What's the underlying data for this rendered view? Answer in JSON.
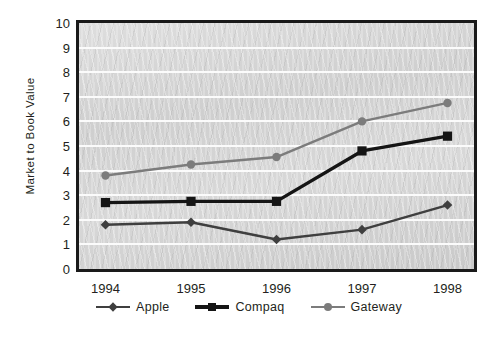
{
  "chart_data": {
    "type": "line",
    "title": "",
    "xlabel": "",
    "ylabel": "Market to Book Value",
    "categories": [
      "1994",
      "1995",
      "1996",
      "1997",
      "1998"
    ],
    "x": [
      1994,
      1995,
      1996,
      1997,
      1998
    ],
    "ylim": [
      0,
      10
    ],
    "yticks": [
      "0",
      "1",
      "2",
      "3",
      "4",
      "5",
      "6",
      "7",
      "8",
      "9",
      "10"
    ],
    "ytick_values": [
      0,
      1,
      2,
      3,
      4,
      5,
      6,
      7,
      8,
      9,
      10
    ],
    "grid": "horizontal",
    "legend_position": "bottom-center",
    "series": [
      {
        "name": "Apple",
        "values": [
          1.8,
          1.9,
          1.2,
          1.6,
          2.6
        ],
        "color": "#3f3f3f",
        "marker": "diamond"
      },
      {
        "name": "Compaq",
        "values": [
          2.7,
          2.75,
          2.75,
          4.8,
          5.4
        ],
        "color": "#151515",
        "marker": "square"
      },
      {
        "name": "Gateway",
        "values": [
          3.8,
          4.25,
          4.55,
          6.0,
          6.75
        ],
        "color": "#7c7c7c",
        "marker": "circle"
      }
    ]
  },
  "colors": {
    "plot_background": "#d4d4d4",
    "gridline": "#fbfbfb",
    "frame": "#1a1a1a",
    "text": "#231f20",
    "apple": "#3f3f3f",
    "compaq": "#151515",
    "gateway": "#7c7c7c"
  }
}
